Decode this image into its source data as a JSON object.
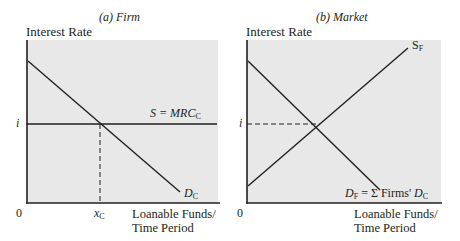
{
  "panels": [
    {
      "title": "(a) Firm",
      "y_axis_label": "Interest Rate",
      "x_axis_label_line1": "Loanable Funds/",
      "x_axis_label_line2": "Time Period",
      "origin_label": "0",
      "rate_label": "i",
      "quantity_label_main": "x",
      "quantity_label_sub": "C",
      "supply_label_main": "S = MRC",
      "supply_label_sub": "C",
      "demand_label_main": "D",
      "demand_label_sub": "C"
    },
    {
      "title": "(b) Market",
      "y_axis_label": "Interest Rate",
      "x_axis_label_line1": "Loanable Funds/",
      "x_axis_label_line2": "Time Period",
      "origin_label": "0",
      "rate_label": "i",
      "supply_label_main": "S",
      "supply_label_sub": "F",
      "demand_label_main": "D",
      "demand_label_sub": "F",
      "demand_label_rest": " = Σ Firms' ",
      "demand_label_main2": "D",
      "demand_label_sub2": "C"
    }
  ],
  "colors": {
    "plot_background": "#e8e8e9",
    "line": "#231f20"
  }
}
